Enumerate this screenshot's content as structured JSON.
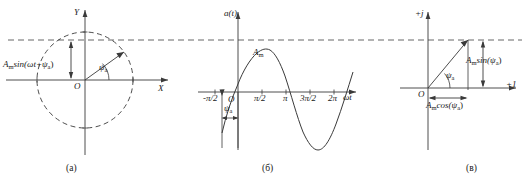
{
  "figure": {
    "kind": "sinusoid-phasor-diagram",
    "dashed_reference_level": "A_m sin(psi_a)",
    "panels": [
      {
        "id": "a",
        "caption": "(а)",
        "type": "rotating-vector-circle",
        "axes": {
          "vertical": "Y",
          "horizontal": "X",
          "origin": "O"
        },
        "labels": {
          "projection": "sin(ωt+ψ",
          "projection_prefix": "A",
          "projection_prefix_sub": "m",
          "projection_sub": "a",
          "projection_suffix": ")",
          "angle": "ψ",
          "angle_sub": "a"
        }
      },
      {
        "id": "b",
        "caption": "(б)",
        "type": "sinusoid-waveform",
        "axes": {
          "vertical": "a(t)",
          "horizontal": "ωt",
          "origin": "O"
        },
        "ticks": [
          "-π/2",
          "π/2",
          "π",
          "3π/2",
          "2π"
        ],
        "labels": {
          "amplitude": "A",
          "amplitude_sub": "m",
          "phase": "ψ",
          "phase_sub": "a"
        }
      },
      {
        "id": "c",
        "caption": "(в)",
        "type": "complex-plane-phasor",
        "axes": {
          "vertical": "+j",
          "horizontal": "+1",
          "origin": "O"
        },
        "labels": {
          "imag_prefix": "A",
          "imag_prefix_sub": "m",
          "imag": "sin(ψ",
          "imag_sub": "a",
          "imag_suffix": ")",
          "real_prefix": "A",
          "real_prefix_sub": "m",
          "real": "cos(ψ",
          "real_sub": "a",
          "real_suffix": ")",
          "angle": "ψ",
          "angle_sub": "a"
        }
      }
    ]
  },
  "colors": {
    "ink": "#1a1a1a",
    "line": "#3a3a3a",
    "dashed": "#555555",
    "background": "#ffffff"
  }
}
